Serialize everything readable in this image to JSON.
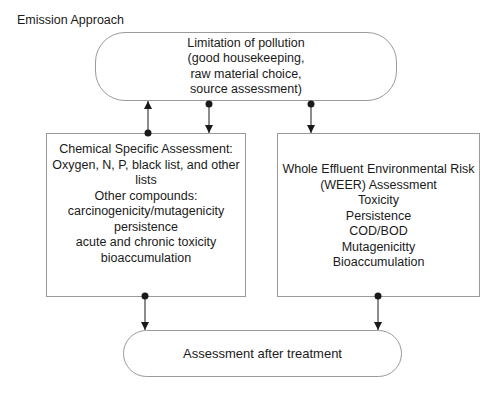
{
  "title": "Emission Approach",
  "nodes": {
    "top": {
      "lines": [
        "Limitation of  pollution",
        "(good housekeeping,",
        "raw material choice,",
        "source assessment)"
      ]
    },
    "left": {
      "lines": [
        "Chemical Specific Assessment:",
        "Oxygen, N, P, black list, and other",
        "lists",
        "Other compounds:",
        "carcinogenicity/mutagenicity",
        "persistence",
        "acute and chronic toxicity",
        "bioaccumulation"
      ]
    },
    "right": {
      "lines": [
        "Whole Effluent Environmental Risk",
        "(WEER) Assessment",
        "Toxicity",
        "Persistence",
        "COD/BOD",
        "Mutagenicitty",
        "Bioaccumulation"
      ]
    },
    "bottom": {
      "label": "Assessment after treatment"
    }
  },
  "edges": [
    {
      "from": "left",
      "to": "top",
      "style": "dot-to-arrow"
    },
    {
      "from": "top",
      "to": "left",
      "style": "dot-to-arrow"
    },
    {
      "from": "top",
      "to": "right",
      "style": "dot-to-arrow"
    },
    {
      "from": "left",
      "to": "bottom",
      "style": "dot-to-arrow"
    },
    {
      "from": "right",
      "to": "bottom",
      "style": "dot-to-arrow"
    }
  ],
  "colors": {
    "line": "#1a1a1a",
    "border": "#9a9a9a"
  }
}
